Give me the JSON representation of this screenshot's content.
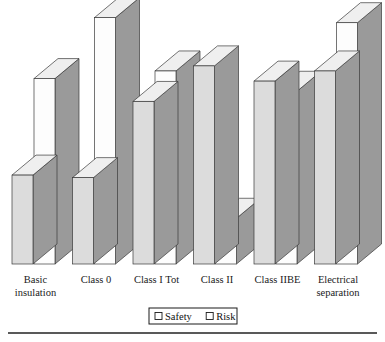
{
  "chart_data": {
    "type": "bar",
    "title": "",
    "subtitle": "",
    "xlabel": "",
    "ylabel": "",
    "grid": false,
    "three_d": true,
    "legend_position": "bottom",
    "ylim": [
      0,
      100
    ],
    "categories": [
      "Basic insulation",
      "Class 0",
      "Class I Tot",
      "Class II",
      "Class IIBE",
      "Electrical separation"
    ],
    "category_lines": [
      [
        "Basic",
        "insulation"
      ],
      [
        "Class 0",
        ""
      ],
      [
        "Class I Tot",
        ""
      ],
      [
        "Class II",
        ""
      ],
      [
        "Class IIBE",
        ""
      ],
      [
        "Electrical",
        "separation"
      ]
    ],
    "series": [
      {
        "name": "Safety",
        "color": "#dcdcdc",
        "values": [
          35,
          34,
          64,
          78,
          72,
          76
        ]
      },
      {
        "name": "Risk",
        "color": "#fdfdfd",
        "values": [
          73,
          97,
          76,
          18,
          68,
          95
        ]
      }
    ]
  },
  "legend": {
    "items": [
      {
        "label": "Safety",
        "swatch": "#ffffff",
        "marker": "square-outline-icon"
      },
      {
        "label": "Risk",
        "swatch": "#ffffff",
        "marker": "square-outline-icon"
      }
    ]
  },
  "colors": {
    "safety_front": "#dcdcdc",
    "safety_side": "#9a9a9a",
    "safety_top": "#efefef",
    "risk_front": "#fdfdfd",
    "risk_side": "#9a9a9a",
    "risk_top": "#efefef",
    "outline": "#3a3a3a",
    "rule": "#222222",
    "text": "#111111"
  },
  "footer": {
    "rule_visible": true
  }
}
